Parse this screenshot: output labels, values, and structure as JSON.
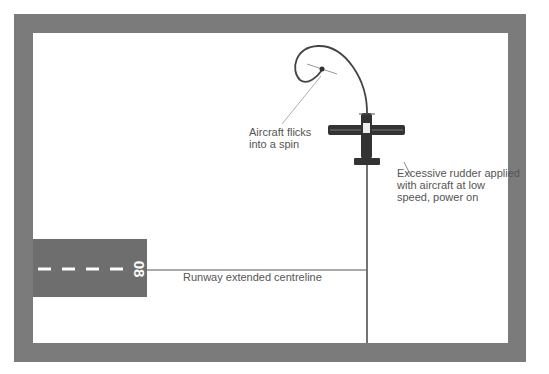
{
  "diagram": {
    "runway": {
      "designator": "08",
      "fill": "#6e6e6e",
      "marking_color": "#ffffff"
    },
    "labels": {
      "spin": "Aircraft flicks\ninto a spin",
      "rudder": "Excessive rudder applied\nwith aircraft at low\nspeed, power on",
      "centreline": "Runway extended centreline"
    },
    "colors": {
      "frame": "#7b7b7b",
      "line": "#444444",
      "text": "#555555"
    }
  }
}
